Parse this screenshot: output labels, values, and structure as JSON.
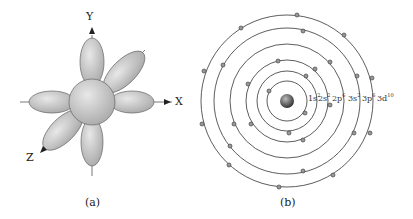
{
  "panel_a": {
    "caption": "(a)",
    "axes": {
      "x": "X",
      "y": "Y",
      "z": "Z"
    }
  },
  "panel_b": {
    "caption": "(b)",
    "shells": [
      {
        "label": "1s",
        "exp": "2"
      },
      {
        "label": "2s",
        "exp": "2"
      },
      {
        "label": "2p",
        "exp": "6"
      },
      {
        "label": "3s",
        "exp": "2"
      },
      {
        "label": "3p",
        "exp": "6"
      },
      {
        "label": "3d",
        "exp": "10"
      }
    ]
  }
}
